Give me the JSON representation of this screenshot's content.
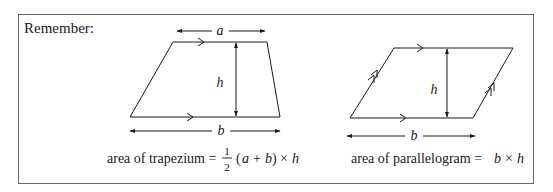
{
  "heading": "Remember:",
  "trapezium": {
    "top_label": "a",
    "height_label": "h",
    "bottom_label": "b",
    "formula": {
      "prefix": "area of trapezium =",
      "frac_num": "1",
      "frac_den": "2",
      "open": "(",
      "a": "a",
      "plus": "+",
      "b": "b",
      "close": ")",
      "times": "×",
      "h": "h"
    }
  },
  "parallelogram": {
    "height_label": "h",
    "bottom_label": "b",
    "formula": {
      "prefix": "area of parallelogram =",
      "b": "b",
      "times": "×",
      "h": "h"
    }
  },
  "colors": {
    "ink": "#1a1a1a",
    "frame": "#6a6a6a"
  }
}
